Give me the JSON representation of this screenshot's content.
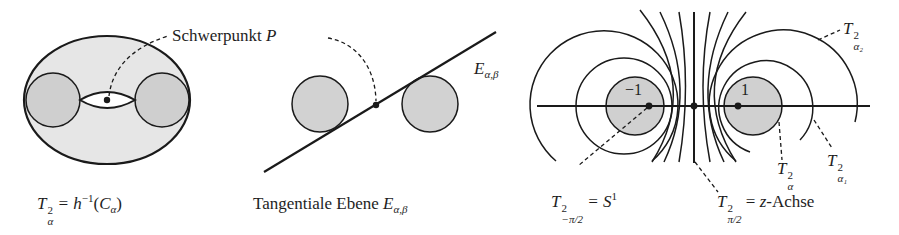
{
  "figure": {
    "panel1": {
      "annotation_label": "Schwerpunkt",
      "annotation_symbol": "P",
      "caption": {
        "lhs_base": "T",
        "lhs_sup": "2",
        "lhs_sub": "α",
        "rhs": "= h",
        "rhs_sup": "−1",
        "rhs_arg_open": "(",
        "rhs_arg": "C",
        "rhs_arg_sub": "α",
        "rhs_arg_close": ")"
      }
    },
    "panel2": {
      "plane_label_base": "E",
      "plane_label_sub": "α,β",
      "caption": {
        "text": "Tangentiale Ebene",
        "symbol_base": "E",
        "symbol_sub": "α,β"
      }
    },
    "panel3": {
      "point_left_label": "−1",
      "point_right_label": "1",
      "label_alpha2": {
        "base": "T",
        "sup": "2",
        "sub": "α₂"
      },
      "label_alpha1": {
        "base": "T",
        "sup": "2",
        "sub": "α₁"
      },
      "label_alpha": {
        "base": "T",
        "sup": "2",
        "sub": "α"
      },
      "caption_left": {
        "base": "T",
        "sup": "2",
        "sub": "−π/2",
        "rhs": "= S",
        "rhs_sup": "1"
      },
      "caption_right": {
        "base": "T",
        "sup": "2",
        "sub": "π/2",
        "rhs": "= ",
        "rhs_var": "z",
        "rhs_text": "-Achse"
      }
    },
    "colors": {
      "stroke": "#1a1a1a",
      "torus_fill": "#e6e6e6",
      "circle_fill": "#cfcfcf",
      "hole_fill": "#ffffff"
    }
  }
}
